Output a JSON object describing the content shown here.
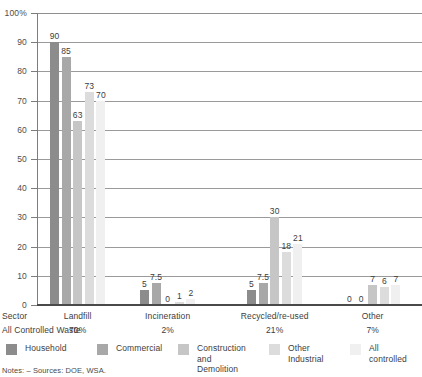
{
  "chart_data": {
    "type": "bar",
    "title": "",
    "xlabel": "Sector",
    "ylabel": "",
    "ylim": [
      0,
      100
    ],
    "yticks": [
      "0",
      "10",
      "20",
      "30",
      "40",
      "50",
      "60",
      "70",
      "80",
      "90",
      "100%"
    ],
    "ytick_values": [
      0,
      10,
      20,
      30,
      40,
      50,
      60,
      70,
      80,
      90,
      100
    ],
    "grid": "horizontal",
    "legend_position": "bottom",
    "categories": [
      "Landfill",
      "Incineration",
      "Recycled/re-used",
      "Other"
    ],
    "series": [
      {
        "name": "Household",
        "color": "#8c8c8c",
        "values": [
          90,
          5,
          5,
          0
        ]
      },
      {
        "name": "Commercial",
        "color": "#a8a8a8",
        "values": [
          85,
          7.5,
          7.5,
          0
        ]
      },
      {
        "name": "Construction\nand Demolition",
        "color": "#c6c6c6",
        "values": [
          63,
          0,
          30,
          7
        ]
      },
      {
        "name": "Other Industrial",
        "color": "#dcdcdc",
        "values": [
          73,
          1,
          18,
          6
        ]
      },
      {
        "name": "All controlled",
        "color": "#f0f0f0",
        "values": [
          70,
          2,
          21,
          7
        ]
      }
    ],
    "bar_value_labels": {
      "Landfill": [
        "90",
        "85",
        "63",
        "73",
        "70"
      ],
      "Incineration": [
        "5",
        "7.5",
        "0",
        "1",
        "2"
      ],
      "Recycled/re-used": [
        "5",
        "7.5",
        "30",
        "18",
        "21"
      ],
      "Other": [
        "0",
        "0",
        "7",
        "6",
        "7"
      ]
    }
  },
  "axis": {
    "sector_row_label": "Sector",
    "all_controlled_row_label": "All Controlled Waste",
    "sector_values": [
      "Landfill",
      "Incineration",
      "Recycled/re-used",
      "Other"
    ],
    "all_controlled_values": [
      "70%",
      "2%",
      "21%",
      "7%"
    ]
  },
  "legend": {
    "items": [
      {
        "label": "Household",
        "color": "#8c8c8c"
      },
      {
        "label": "Commercial",
        "color": "#a8a8a8"
      },
      {
        "label": "Construction\nand Demolition",
        "color": "#c6c6c6"
      },
      {
        "label": "Other Industrial",
        "color": "#dcdcdc"
      },
      {
        "label": "All controlled",
        "color": "#f0f0f0"
      }
    ]
  },
  "footer": {
    "notes": "Notes:  –  Sources: DOE, WSA."
  }
}
